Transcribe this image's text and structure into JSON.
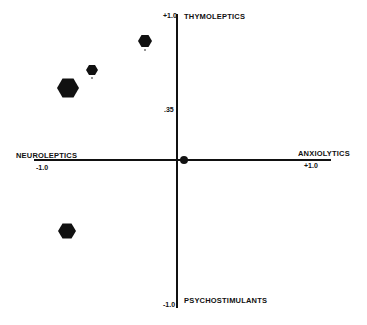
{
  "diagram": {
    "axes": {
      "top_label": "THYMOLEPTICS",
      "bottom_label": "PSYCHOSTIMULANTS",
      "left_label": "NEUROLEPTICS",
      "right_label": "ANXIOLYTICS",
      "top_tick": "+1.0",
      "bottom_tick": "-1.0",
      "left_tick": "-1.0",
      "right_tick": "+1.0",
      "mid_tick": ".35"
    },
    "points": [
      {
        "name": "point-1",
        "x": 145,
        "y": 41,
        "size": "medium",
        "r": 7
      },
      {
        "name": "point-2",
        "x": 92,
        "y": 70,
        "size": "small",
        "r": 6
      },
      {
        "name": "point-3",
        "x": 68,
        "y": 88,
        "size": "large",
        "r": 11
      },
      {
        "name": "point-4",
        "x": 184,
        "y": 160,
        "size": "dot",
        "r": 4
      },
      {
        "name": "point-5",
        "x": 67,
        "y": 231,
        "size": "medium",
        "r": 9
      }
    ],
    "colors": {
      "ink": "#111111",
      "background": "#ffffff"
    }
  }
}
